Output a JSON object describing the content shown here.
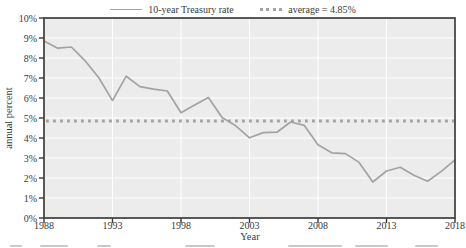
{
  "legend": {
    "series_label": "10-year Treasury rate",
    "average_label": "average = 4.85%"
  },
  "chart_data": {
    "type": "line",
    "title": "",
    "xlabel": "Year",
    "ylabel": "annual percent",
    "xlim": [
      1988,
      2018
    ],
    "ylim": [
      0,
      10
    ],
    "grid": true,
    "legend_position": "top",
    "x": [
      1988,
      1989,
      1990,
      1991,
      1992,
      1993,
      1994,
      1995,
      1996,
      1997,
      1998,
      1999,
      2000,
      2001,
      2002,
      2003,
      2004,
      2005,
      2006,
      2007,
      2008,
      2009,
      2010,
      2011,
      2012,
      2013,
      2014,
      2015,
      2016,
      2017,
      2018
    ],
    "series": [
      {
        "name": "10-year Treasury rate",
        "values": [
          8.85,
          8.49,
          8.55,
          7.86,
          7.01,
          5.87,
          7.09,
          6.57,
          6.44,
          6.35,
          5.26,
          5.65,
          6.03,
          5.02,
          4.61,
          4.01,
          4.27,
          4.29,
          4.8,
          4.63,
          3.66,
          3.26,
          3.22,
          2.78,
          1.8,
          2.35,
          2.54,
          2.14,
          1.84,
          2.33,
          2.91
        ]
      }
    ],
    "average": 4.85,
    "xticks": [
      {
        "value": 1988,
        "label": "1988"
      },
      {
        "value": 1993,
        "label": "1993"
      },
      {
        "value": 1998,
        "label": "1998"
      },
      {
        "value": 2003,
        "label": "2003"
      },
      {
        "value": 2008,
        "label": "2008"
      },
      {
        "value": 2013,
        "label": "2013"
      },
      {
        "value": 2018,
        "label": "2018"
      }
    ],
    "yticks": [
      {
        "value": 0,
        "label": "0%"
      },
      {
        "value": 1,
        "label": "1%"
      },
      {
        "value": 2,
        "label": "2%"
      },
      {
        "value": 3,
        "label": "3%"
      },
      {
        "value": 4,
        "label": "4%"
      },
      {
        "value": 5,
        "label": "5%"
      },
      {
        "value": 6,
        "label": "6%"
      },
      {
        "value": 7,
        "label": "7%"
      },
      {
        "value": 8,
        "label": "8%"
      },
      {
        "value": 9,
        "label": "9%"
      },
      {
        "value": 10,
        "label": "10%"
      }
    ],
    "colors": {
      "series": "#a3a3a3",
      "average": "#a3a3a3",
      "plot_background": "#ececec",
      "gridline": "#ffffff",
      "frame": "#474747",
      "text": "#3a3a3a"
    }
  }
}
